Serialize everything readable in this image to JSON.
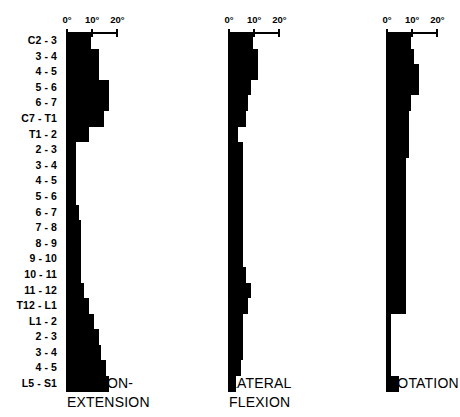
{
  "chart_data": {
    "type": "bar",
    "title": "",
    "orientation": "horizontal",
    "layout": "three side-by-side horizontal bar panels sharing one category axis",
    "grid": false,
    "legend": false,
    "xlabel": "",
    "ylabel": "",
    "xlim": [
      0,
      20
    ],
    "xunit": "degrees",
    "axis": {
      "ticks": [
        0,
        10,
        20
      ],
      "tick_labels": [
        "0°",
        "10°",
        "20°"
      ]
    },
    "categories": [
      "C2 - 3",
      "3 - 4",
      "4 - 5",
      "5 - 6",
      "6 - 7",
      "C7 - T1",
      "T1 - 2",
      "2 - 3",
      "3 - 4",
      "4 - 5",
      "5 - 6",
      "6 - 7",
      "7 - 8",
      "8 - 9",
      "9 - 10",
      "10 - 11",
      "11 - 12",
      "T12 - L1",
      "L1 - 2",
      "2 - 3",
      "3 - 4",
      "4 - 5",
      "L5 - S1"
    ],
    "series": [
      {
        "name": "FLEXION-EXTENSION",
        "caption_lines": [
          "FLEXION-",
          "EXTENSION"
        ],
        "values": [
          10,
          13,
          13,
          17,
          17,
          15,
          9,
          4,
          4,
          4,
          4,
          5,
          6,
          6,
          6,
          6,
          7,
          9,
          11,
          13,
          14,
          16,
          17
        ]
      },
      {
        "name": "LATERAL FLEXION",
        "caption_lines": [
          "LATERAL",
          "FLEXION"
        ],
        "values": [
          10,
          12,
          12,
          9,
          8,
          7,
          4,
          6,
          6,
          6,
          6,
          6,
          6,
          6,
          6,
          7,
          9,
          8,
          6,
          6,
          6,
          5,
          3
        ]
      },
      {
        "name": "ROTATION",
        "caption_lines": [
          "ROTATION"
        ],
        "values": [
          10,
          11,
          13,
          13,
          10,
          9,
          9,
          9,
          8,
          8,
          8,
          8,
          8,
          8,
          8,
          8,
          8,
          8,
          2,
          2,
          2,
          2,
          5
        ]
      }
    ]
  },
  "panels": [
    {
      "id": "flexion-extension",
      "caption_lines": [
        "FLEXION-",
        "EXTENSION"
      ],
      "axis_labels": [
        "0°",
        "10°",
        "20°"
      ]
    },
    {
      "id": "lateral-flexion",
      "caption_lines": [
        "LATERAL",
        "FLEXION"
      ],
      "axis_labels": [
        "0°",
        "10°",
        "20°"
      ]
    },
    {
      "id": "rotation",
      "caption_lines": [
        "ROTATION"
      ],
      "axis_labels": [
        "0°",
        "10°",
        "20°"
      ]
    }
  ],
  "row_labels": [
    "C2 - 3",
    "3 - 4",
    "4 - 5",
    "5 - 6",
    "6 - 7",
    "C7 - T1",
    "T1 - 2",
    "2 - 3",
    "3 - 4",
    "4 - 5",
    "5 - 6",
    "6 - 7",
    "7 - 8",
    "8 - 9",
    "9 - 10",
    "10 - 11",
    "11 - 12",
    "T12 - L1",
    "L1 - 2",
    "2 - 3",
    "3 - 4",
    "4 - 5",
    "L5 - S1"
  ],
  "colors": {
    "bar": "#000000",
    "background": "#ffffff",
    "text": "#000000"
  }
}
